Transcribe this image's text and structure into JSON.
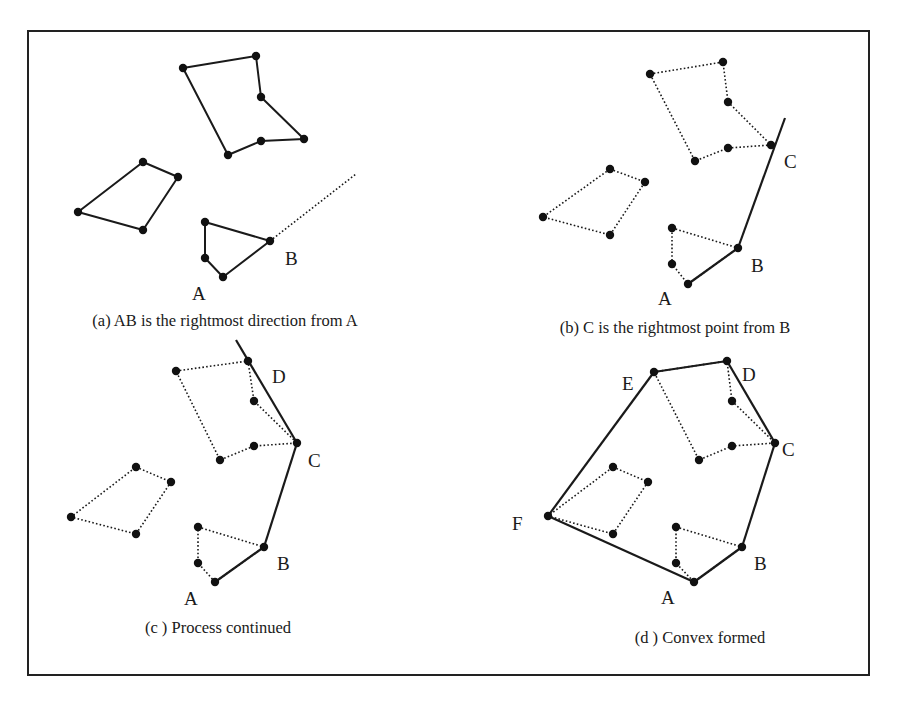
{
  "frame": {
    "x": 28,
    "y": 31,
    "w": 841,
    "h": 644
  },
  "panels": [
    {
      "id": "a",
      "caption": "(a) AB is the rightmost direction from A",
      "caption_pos": [
        225,
        326
      ],
      "polygons": [
        {
          "style": "solid",
          "points": [
            [
              183,
              68
            ],
            [
              256,
              56
            ],
            [
              261,
              97
            ],
            [
              304,
              139
            ],
            [
              261,
              141
            ],
            [
              228,
              155
            ]
          ]
        },
        {
          "style": "solid",
          "points": [
            [
              143,
              162
            ],
            [
              178,
              177
            ],
            [
              143,
              230
            ],
            [
              78,
              212
            ]
          ]
        },
        {
          "style": "solid",
          "points": [
            [
              205,
              222
            ],
            [
              270,
              241
            ],
            [
              223,
              277
            ],
            [
              205,
              258
            ]
          ]
        }
      ],
      "hull_edges": [],
      "rays": [
        {
          "style": "dotted",
          "from": [
            270,
            241
          ],
          "to": [
            356,
            174
          ]
        }
      ],
      "labels": [
        {
          "text": "B",
          "x": 285,
          "y": 265
        },
        {
          "text": "A",
          "x": 192,
          "y": 300
        }
      ]
    },
    {
      "id": "b",
      "caption": "(b) C is the rightmost point from B",
      "caption_pos": [
        675,
        333
      ],
      "polygons": [
        {
          "style": "dotted",
          "points": [
            [
              650,
              74
            ],
            [
              723,
              62
            ],
            [
              728,
              102
            ],
            [
              771,
              145
            ],
            [
              728,
              148
            ],
            [
              695,
              161
            ]
          ]
        },
        {
          "style": "dotted",
          "points": [
            [
              610,
              169
            ],
            [
              645,
              182
            ],
            [
              610,
              235
            ],
            [
              543,
              217
            ]
          ]
        },
        {
          "style": "dotted",
          "points": [
            [
              672,
              228
            ],
            [
              738,
              248
            ],
            [
              688,
              284
            ],
            [
              672,
              264
            ]
          ]
        }
      ],
      "hull_edges": [
        [
          [
            688,
            284
          ],
          [
            738,
            248
          ]
        ],
        [
          [
            738,
            248
          ],
          [
            785,
            118
          ]
        ]
      ],
      "rays": [],
      "labels": [
        {
          "text": "C",
          "x": 784,
          "y": 168
        },
        {
          "text": "B",
          "x": 751,
          "y": 272
        },
        {
          "text": "A",
          "x": 658,
          "y": 305
        }
      ]
    },
    {
      "id": "c",
      "caption": "(c ) Process continued",
      "caption_pos": [
        218,
        633
      ],
      "polygons": [
        {
          "style": "dotted",
          "points": [
            [
              176,
              371
            ],
            [
              248,
              361
            ],
            [
              254,
              401
            ],
            [
              297,
              443
            ],
            [
              254,
              446
            ],
            [
              220,
              460
            ]
          ]
        },
        {
          "style": "dotted",
          "points": [
            [
              136,
              467
            ],
            [
              171,
              482
            ],
            [
              136,
              534
            ],
            [
              71,
              517
            ]
          ]
        },
        {
          "style": "dotted",
          "points": [
            [
              198,
              527
            ],
            [
              264,
              547
            ],
            [
              215,
              582
            ],
            [
              198,
              563
            ]
          ]
        }
      ],
      "hull_edges": [
        [
          [
            215,
            582
          ],
          [
            264,
            547
          ]
        ],
        [
          [
            264,
            547
          ],
          [
            297,
            443
          ]
        ],
        [
          [
            297,
            443
          ],
          [
            236,
            340
          ]
        ]
      ],
      "rays": [],
      "labels": [
        {
          "text": "D",
          "x": 272,
          "y": 383
        },
        {
          "text": "C",
          "x": 308,
          "y": 467
        },
        {
          "text": "B",
          "x": 277,
          "y": 570
        },
        {
          "text": "A",
          "x": 184,
          "y": 605
        }
      ]
    },
    {
      "id": "d",
      "caption": "(d ) Convex formed",
      "caption_pos": [
        700,
        643
      ],
      "polygons": [
        {
          "style": "dotted",
          "points": [
            [
              654,
              372
            ],
            [
              727,
              361
            ],
            [
              732,
              401
            ],
            [
              775,
              443
            ],
            [
              732,
              446
            ],
            [
              699,
              460
            ]
          ]
        },
        {
          "style": "dotted",
          "points": [
            [
              613,
              467
            ],
            [
              648,
              482
            ],
            [
              613,
              534
            ],
            [
              548,
              516
            ]
          ]
        },
        {
          "style": "dotted",
          "points": [
            [
              676,
              527
            ],
            [
              742,
              547
            ],
            [
              694,
              582
            ],
            [
              676,
              563
            ]
          ]
        }
      ],
      "hull_edges": [
        [
          [
            694,
            582
          ],
          [
            742,
            547
          ]
        ],
        [
          [
            742,
            547
          ],
          [
            775,
            443
          ]
        ],
        [
          [
            775,
            443
          ],
          [
            727,
            361
          ]
        ],
        [
          [
            727,
            361
          ],
          [
            654,
            372
          ]
        ],
        [
          [
            654,
            372
          ],
          [
            548,
            516
          ]
        ],
        [
          [
            548,
            516
          ],
          [
            694,
            582
          ]
        ]
      ],
      "rays": [],
      "labels": [
        {
          "text": "E",
          "x": 622,
          "y": 390
        },
        {
          "text": "D",
          "x": 742,
          "y": 381
        },
        {
          "text": "C",
          "x": 782,
          "y": 456
        },
        {
          "text": "F",
          "x": 512,
          "y": 530
        },
        {
          "text": "B",
          "x": 754,
          "y": 570
        },
        {
          "text": "A",
          "x": 661,
          "y": 604
        }
      ]
    }
  ]
}
